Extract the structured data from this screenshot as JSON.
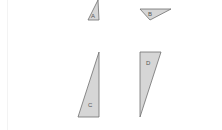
{
  "diagram": {
    "shapes": [
      {
        "id": "A",
        "label": "A",
        "points": "98,0 88,20 99,20",
        "label_pos": [
          93,
          17
        ]
      },
      {
        "id": "B",
        "label": "B",
        "points": "140,9 171,9 150,20",
        "label_pos": [
          149,
          16
        ]
      },
      {
        "id": "C",
        "label": "C",
        "points": "99,52 78,117 99,117",
        "label_pos": [
          90,
          107
        ]
      },
      {
        "id": "D",
        "label": "D",
        "points": "140,52 161,52 140,117",
        "label_pos": [
          148,
          65
        ]
      }
    ],
    "colors": {
      "fill": "#d6d6d6",
      "stroke": "#6e6e6e",
      "label": "#555555"
    }
  }
}
